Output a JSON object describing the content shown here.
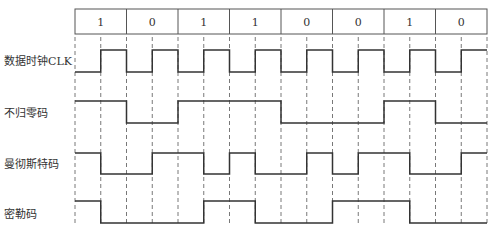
{
  "bits": [
    "1",
    "0",
    "1",
    "1",
    "0",
    "0",
    "1",
    "0"
  ],
  "rows": [
    {
      "label": "数据时钟CLK",
      "key": "clk"
    },
    {
      "label": "不归零码",
      "key": "nrz"
    },
    {
      "label": "曼彻斯特码",
      "key": "manchester"
    },
    {
      "label": "密勒码",
      "key": "miller"
    }
  ],
  "colors": {
    "line": "#333333",
    "dash": "#555555",
    "text": "#333333"
  }
}
